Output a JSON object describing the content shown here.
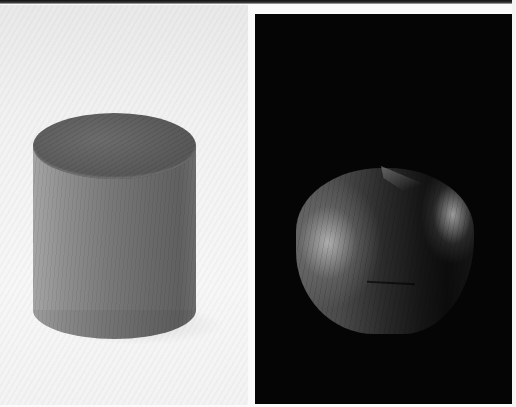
{
  "image": {
    "description": "Two side-by-side grayscale photographs of wooden objects",
    "panels": [
      {
        "position": "left",
        "subject": "wooden cylinder",
        "background": "white",
        "colors": {
          "background": "#f4f4f4",
          "body_light": "#a4a4a4",
          "body_dark": "#606060",
          "top_face": "#5a5a5a"
        }
      },
      {
        "position": "right",
        "subject": "dome-shaped wooden object with pinched peak",
        "background": "black",
        "colors": {
          "background": "#050505",
          "highlight": "#bebebe",
          "shadow": "#0c0c0c"
        }
      }
    ]
  }
}
